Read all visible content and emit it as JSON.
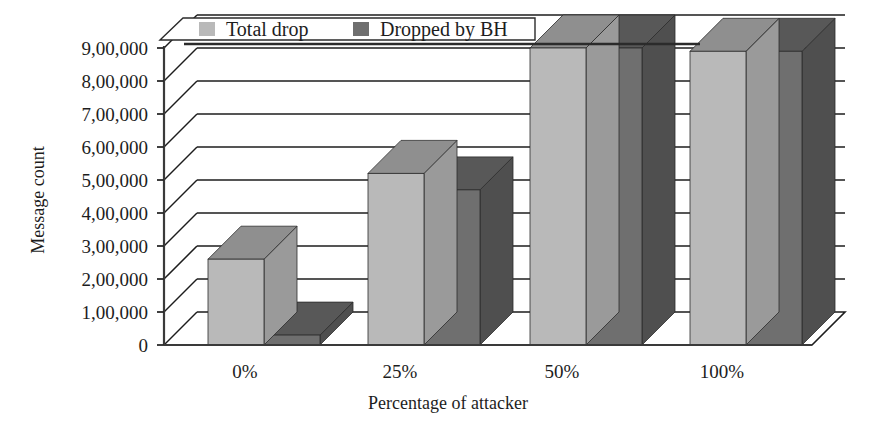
{
  "chart_data": {
    "type": "bar",
    "title": "",
    "subtitle": "",
    "xlabel": "Percentage of attacker",
    "ylabel": "Message count",
    "categories": [
      "0%",
      "25%",
      "50%",
      "100%"
    ],
    "series": [
      {
        "name": "Total drop",
        "values": [
          260000,
          520000,
          900000,
          890000
        ],
        "color": "#b9b9b9"
      },
      {
        "name": "Dropped by BH",
        "values": [
          30000,
          470000,
          900000,
          890000
        ],
        "color": "#6f6f6f"
      }
    ],
    "ylim": [
      0,
      900000
    ],
    "ytick_values": [
      0,
      100000,
      200000,
      300000,
      400000,
      500000,
      600000,
      700000,
      800000,
      900000
    ],
    "ytick_labels": [
      "0",
      "1,00,000",
      "2,00,000",
      "3,00,000",
      "4,00,000",
      "5,00,000",
      "6,00,000",
      "7,00,000",
      "8,00,000",
      "9,00,000"
    ],
    "grid": true,
    "grid_orientation": "horizontal",
    "legend_position": "top-center",
    "style": "3d-clustered-column",
    "legend": [
      {
        "label": "Total drop",
        "swatch": "#b9b9b9"
      },
      {
        "label": "Dropped by BH",
        "swatch": "#6f6f6f"
      }
    ]
  },
  "axis": {
    "y_title": "Message count",
    "x_title": "Percentage of attacker",
    "y_labels": {
      "t0": "0",
      "t1": "1,00,000",
      "t2": "2,00,000",
      "t3": "3,00,000",
      "t4": "4,00,000",
      "t5": "5,00,000",
      "t6": "6,00,000",
      "t7": "7,00,000",
      "t8": "8,00,000",
      "t9": "9,00,000"
    },
    "x_labels": {
      "c0": "0%",
      "c1": "25%",
      "c2": "50%",
      "c3": "100%"
    }
  },
  "legend": {
    "item1_label": "Total drop",
    "item2_label": "Dropped by BH"
  },
  "colors": {
    "series_light_front": "#b9b9b9",
    "series_light_top": "#8f8f8f",
    "series_light_side": "#9a9a9a",
    "series_dark_front": "#6f6f6f",
    "series_dark_top": "#585858",
    "series_dark_side": "#4f4f4f",
    "line": "#1d1d1d",
    "background": "#ffffff"
  }
}
